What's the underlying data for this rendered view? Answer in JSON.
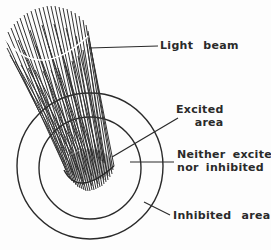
{
  "diagram": {
    "labels": {
      "light_beam": "Light  beam",
      "excited_line1": "Excited",
      "excited_line2": "area",
      "neither_line1": "Neither excited",
      "neither_line2": "nor inhibited",
      "inhibited": "Inhibited  area"
    },
    "colors": {
      "ink": "#2a2a2a",
      "background": "#fdfdfd"
    }
  }
}
